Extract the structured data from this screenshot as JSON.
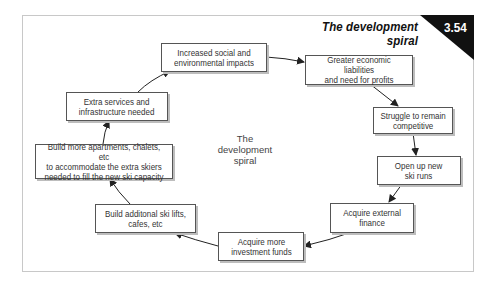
{
  "figure": {
    "title": "The development spiral",
    "number": "3.54",
    "center_label": "The\ndevelopment\nspiral"
  },
  "colors": {
    "badge_bg": "#111111",
    "box_border": "#555555",
    "box_shadow": "#bdbdbd",
    "arrow": "#222222",
    "frame_border": "#c8c8c8"
  },
  "nodes": [
    {
      "id": "social",
      "text": "Increased social and\nenvironmental impacts"
    },
    {
      "id": "liabilities",
      "text": "Greater economic liabilities\nand need for profits"
    },
    {
      "id": "struggle",
      "text": "Struggle to remain\ncompetitive"
    },
    {
      "id": "runs",
      "text": "Open up new\nski runs"
    },
    {
      "id": "external",
      "text": "Acquire external\nfinance"
    },
    {
      "id": "investment",
      "text": "Acquire more\ninvestment funds"
    },
    {
      "id": "lifts",
      "text": "Build additonal ski lifts,\ncafes, etc"
    },
    {
      "id": "apartments",
      "text": "Build more apartments, chalets, etc\nto accommodate the extra skiers\nneeded to fill the new ski capacity"
    },
    {
      "id": "services",
      "text": "Extra services and\ninfrastructure needed"
    }
  ],
  "edges": [
    [
      "social",
      "liabilities"
    ],
    [
      "liabilities",
      "struggle"
    ],
    [
      "struggle",
      "runs"
    ],
    [
      "runs",
      "external"
    ],
    [
      "external",
      "investment"
    ],
    [
      "investment",
      "lifts"
    ],
    [
      "lifts",
      "apartments"
    ],
    [
      "apartments",
      "services"
    ],
    [
      "services",
      "social"
    ]
  ]
}
